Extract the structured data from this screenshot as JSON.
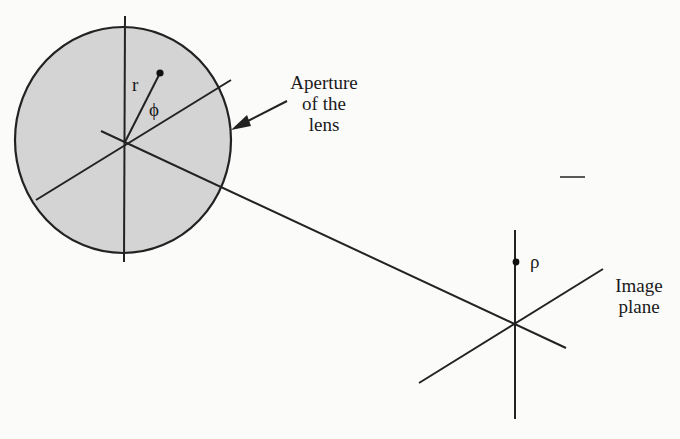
{
  "diagram": {
    "lens": {
      "label_line1": "Aperture",
      "label_line2": "of the",
      "label_line3": "lens",
      "radius_symbol": "r",
      "angle_symbol": "ϕ",
      "fill_color": "#d4d4d4",
      "stroke_color": "#222222"
    },
    "image_plane": {
      "label_line1": "Image",
      "label_line2": "plane",
      "point_symbol": "ρ"
    },
    "line_color": "#222222"
  }
}
